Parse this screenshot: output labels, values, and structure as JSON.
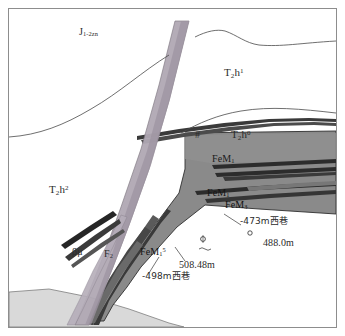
{
  "figure": {
    "type": "geological-cross-section",
    "background_color": "#ffffff",
    "frame_color": "#8d8d8d"
  },
  "colors": {
    "ore_body": "#8a8a8a",
    "ore_band_dark": "#2f2f2f",
    "dike_band": "#b0a8b4",
    "dike_band_dark": "#9d94a2",
    "basal_unit": "#d9d9d9",
    "line": "#3a3a3a",
    "text": "#2b2b2b"
  },
  "strata_labels": [
    {
      "id": "j1-2zn",
      "base": "J",
      "sub": "1-2zn",
      "sup": "",
      "x": 70,
      "y": 22
    },
    {
      "id": "t2h1",
      "base": "T",
      "sub": "2",
      "sup": "1",
      "after": "h",
      "x": 215,
      "y": 64
    },
    {
      "id": "t2h0",
      "base": "T",
      "sub": "2",
      "sup": "0",
      "after": "h",
      "x": 222,
      "y": 126
    },
    {
      "id": "t2h2",
      "base": "T",
      "sub": "2",
      "sup": "2",
      "after": "h",
      "x": 40,
      "y": 181
    }
  ],
  "ore_labels": [
    {
      "id": "fem1-upper",
      "base": "FeM",
      "sub": "1",
      "sup": "",
      "x": 203,
      "y": 150
    },
    {
      "id": "fem1-middle",
      "base": "FeM",
      "sub": "1",
      "sup": "",
      "x": 198,
      "y": 184
    },
    {
      "id": "fem3-lower",
      "base": "FeM",
      "sub": "3",
      "sup": "",
      "x": 216,
      "y": 196
    },
    {
      "id": "fem1-5-left",
      "base": "FeM",
      "sub": "1",
      "sup": "5",
      "x": 131,
      "y": 243
    }
  ],
  "structure_labels": [
    {
      "id": "beta-mu",
      "text": "βμ",
      "x": 63,
      "y": 243
    },
    {
      "id": "f2-fault",
      "base": "F",
      "sub": "2",
      "sup": "",
      "x": 95,
      "y": 245
    },
    {
      "id": "hash-marker",
      "text": "#",
      "x": 186,
      "y": 127
    }
  ],
  "annotations": [
    {
      "id": "level-473",
      "text": "-473m西巷",
      "x": 231,
      "y": 213,
      "font": "cjk"
    },
    {
      "id": "depth-488",
      "text": "488.0m",
      "x": 254,
      "y": 234,
      "font": "serif"
    },
    {
      "id": "depth-508",
      "text": "508.48m",
      "x": 170,
      "y": 256,
      "font": "serif"
    },
    {
      "id": "level-498",
      "text": "-498m西巷",
      "x": 133,
      "y": 268,
      "font": "cjk"
    }
  ],
  "borehole_symbols": [
    {
      "id": "borehole-upper",
      "x": 194,
      "y": 230
    },
    {
      "id": "borehole-lower",
      "x": 241,
      "y": 224
    }
  ]
}
